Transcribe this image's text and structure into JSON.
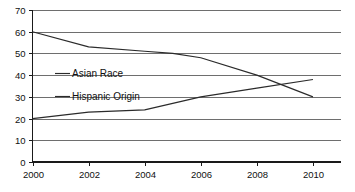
{
  "chart_data": {
    "type": "line",
    "title": "",
    "subtitle": "",
    "xlabel": "",
    "ylabel": "",
    "xlim": [
      2000,
      2011
    ],
    "ylim": [
      0,
      70
    ],
    "grid": true,
    "grid_axis": "y",
    "legend_position": "inside-left",
    "x_ticks": [
      "2000",
      "2002",
      "2004",
      "2006",
      "2008",
      "2010"
    ],
    "x_tick_values": [
      2000,
      2002,
      2004,
      2006,
      2008,
      2010
    ],
    "y_ticks": [
      "0",
      "10",
      "20",
      "30",
      "40",
      "50",
      "60",
      "70"
    ],
    "y_tick_values": [
      0,
      10,
      20,
      30,
      40,
      50,
      60,
      70
    ],
    "series": [
      {
        "name": "Asian Race",
        "color": "#2b2b2b",
        "x": [
          2000,
          2002,
          2004,
          2005,
          2006,
          2008,
          2010
        ],
        "values": [
          60,
          53,
          51,
          50,
          48,
          40,
          30
        ]
      },
      {
        "name": "Hispanic Origin",
        "color": "#2b2b2b",
        "x": [
          2000,
          2002,
          2004,
          2006,
          2008,
          2010
        ],
        "values": [
          20,
          23,
          24,
          30,
          34,
          38
        ]
      }
    ]
  },
  "legend": {
    "entries": [
      {
        "label": "Asian Race"
      },
      {
        "label": "Hispanic Origin"
      }
    ]
  },
  "colors": {
    "line": "#2b2b2b",
    "gridline": "#6e6e6e",
    "axis": "#1a1a1a",
    "background": "#ffffff",
    "text": "#111111"
  }
}
